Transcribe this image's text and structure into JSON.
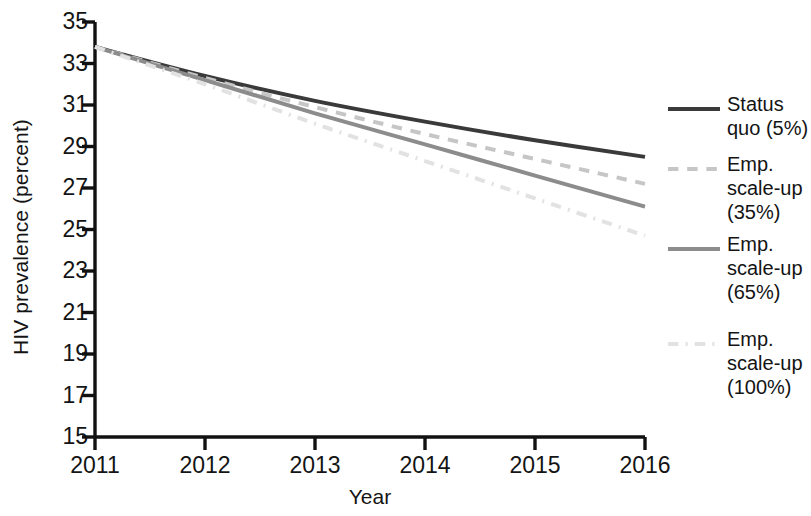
{
  "chart_data": {
    "type": "line",
    "title": "",
    "xlabel": "Year",
    "ylabel": "HIV prevalence (percent)",
    "x": [
      2011,
      2012,
      2013,
      2014,
      2015,
      2016
    ],
    "xtick_labels": [
      "2011",
      "2012",
      "2013",
      "2014",
      "2015",
      "2016"
    ],
    "ytick_labels": [
      "35",
      "33",
      "31",
      "29",
      "27",
      "25",
      "23",
      "21",
      "19",
      "17",
      "15"
    ],
    "ytick_values": [
      35,
      33,
      31,
      29,
      27,
      25,
      23,
      21,
      19,
      17,
      15
    ],
    "xlim": [
      2011,
      2016
    ],
    "ylim": [
      15,
      35
    ],
    "grid": false,
    "legend_position": "right",
    "series": [
      {
        "name": "Status quo (5%)",
        "label_lines": [
          "Status",
          "quo (5%)"
        ],
        "style": "solid",
        "color": "#3a3a3a",
        "width": 4.0,
        "values": [
          33.8,
          32.4,
          31.2,
          30.2,
          29.3,
          28.5
        ]
      },
      {
        "name": "Emp. scale-up (35%)",
        "label_lines": [
          "Emp.",
          "scale-up",
          "(35%)"
        ],
        "style": "dashed",
        "color": "#c6c6c6",
        "width": 4.0,
        "values": [
          33.8,
          32.3,
          30.9,
          29.6,
          28.4,
          27.2
        ]
      },
      {
        "name": "Emp. scale-up (65%)",
        "label_lines": [
          "Emp.",
          "scale-up",
          "(65%)"
        ],
        "style": "solid",
        "color": "#8c8c8c",
        "width": 4.0,
        "values": [
          33.8,
          32.2,
          30.6,
          29.1,
          27.6,
          26.1
        ]
      },
      {
        "name": "Emp. scale-up (100%)",
        "label_lines": [
          "Emp.",
          "scale-up",
          "(100%)"
        ],
        "style": "dashdot",
        "color": "#e2e2e2",
        "width": 4.0,
        "values": [
          33.8,
          32.0,
          30.1,
          28.3,
          26.5,
          24.7
        ]
      }
    ]
  },
  "axis": {
    "color": "#111111"
  }
}
